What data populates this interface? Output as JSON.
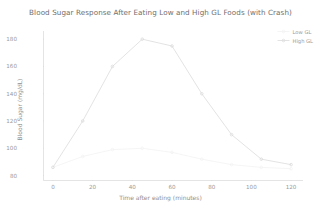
{
  "chart_data": {
    "type": "line",
    "title": "Blood Sugar Response After Eating Low and High GL Foods (with Crash)",
    "xlabel": "Time after eating (minutes)",
    "ylabel": "Blood Sugar (mg/dL)",
    "xlim": [
      -5,
      126
    ],
    "ylim": [
      76,
      186
    ],
    "xticks": [
      0,
      20,
      40,
      60,
      80,
      100,
      120
    ],
    "yticks": [
      80,
      100,
      120,
      140,
      160,
      180
    ],
    "grid": false,
    "legend_position": "upper right",
    "x": [
      0,
      15,
      30,
      45,
      60,
      75,
      90,
      105,
      120
    ],
    "series": [
      {
        "name": "Low GL",
        "color": "#f2f2f2",
        "marker": "o",
        "values": [
          86,
          94,
          99,
          100,
          97,
          92,
          88,
          86,
          85
        ]
      },
      {
        "name": "High GL",
        "color": "#dcdcdc",
        "marker": "o",
        "values": [
          86,
          120,
          160,
          180,
          175,
          140,
          110,
          92,
          88
        ]
      }
    ]
  },
  "axis": {
    "ytick_labels": [
      "180",
      "160",
      "140",
      "120",
      "100",
      "80"
    ],
    "xtick_labels": [
      "0",
      "20",
      "40",
      "60",
      "80",
      "100",
      "120"
    ]
  },
  "legend": {
    "items": [
      {
        "label": "Low GL"
      },
      {
        "label": "High GL"
      }
    ]
  }
}
